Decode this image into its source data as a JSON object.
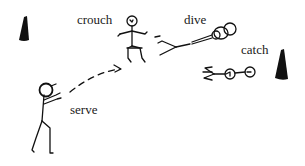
{
  "diagram": {
    "labels": {
      "crouch": "crouch",
      "dive": "dive",
      "catch": "catch",
      "serve": "serve"
    },
    "elements": [
      {
        "id": "cone-left",
        "type": "cone"
      },
      {
        "id": "cone-right",
        "type": "cone"
      },
      {
        "id": "figure-serve",
        "type": "stick-figure",
        "pose": "serve"
      },
      {
        "id": "figure-crouch",
        "type": "stick-figure",
        "pose": "crouch"
      },
      {
        "id": "figure-dive",
        "type": "stick-figure",
        "pose": "dive"
      },
      {
        "id": "figure-catch",
        "type": "stick-figure",
        "pose": "catch"
      },
      {
        "id": "serve-path",
        "type": "dashed-arrow",
        "from": "serve",
        "to": "crouch"
      }
    ],
    "colors": {
      "ink": "#111111",
      "background": "#ffffff"
    }
  }
}
